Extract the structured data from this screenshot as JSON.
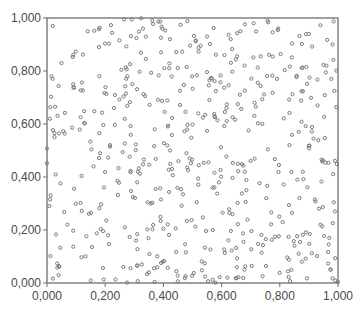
{
  "chart_data": {
    "type": "scatter",
    "title": "",
    "xlabel": "",
    "ylabel": "",
    "xlim": [
      0,
      1
    ],
    "ylim": [
      0,
      1
    ],
    "grid": false,
    "legend": null,
    "x_ticks": [
      0,
      0.2,
      0.4,
      0.6,
      0.8,
      1.0
    ],
    "y_ticks": [
      0,
      0.2,
      0.4,
      0.6,
      0.8,
      1.0
    ],
    "x_tick_labels": [
      "0,000",
      "0,200",
      "0,400",
      "0,600",
      "0,800",
      "1,000"
    ],
    "y_tick_labels": [
      "0,000",
      "0,200",
      "0,400",
      "0,600",
      "0,800",
      "1,000"
    ],
    "marker": "open-circle",
    "marker_color": "#7a7a7a",
    "distribution": "uniform random on unit square",
    "point_count_estimate": 560,
    "series": [
      {
        "name": "points",
        "sample_points": [
          [
            0.02,
            0.97
          ],
          [
            0.14,
            0.95
          ],
          [
            0.33,
            0.96
          ],
          [
            0.55,
            0.93
          ],
          [
            0.71,
            0.98
          ],
          [
            0.9,
            0.94
          ],
          [
            0.05,
            0.83
          ],
          [
            0.18,
            0.78
          ],
          [
            0.42,
            0.81
          ],
          [
            0.61,
            0.86
          ],
          [
            0.79,
            0.77
          ],
          [
            0.96,
            0.82
          ],
          [
            0.01,
            0.62
          ],
          [
            0.23,
            0.66
          ],
          [
            0.37,
            0.58
          ],
          [
            0.52,
            0.64
          ],
          [
            0.74,
            0.6
          ],
          [
            0.93,
            0.67
          ],
          [
            0.03,
            0.41
          ],
          [
            0.16,
            0.44
          ],
          [
            0.31,
            0.38
          ],
          [
            0.49,
            0.47
          ],
          [
            0.68,
            0.42
          ],
          [
            0.86,
            0.39
          ],
          [
            0.07,
            0.22
          ],
          [
            0.21,
            0.18
          ],
          [
            0.39,
            0.25
          ],
          [
            0.57,
            0.2
          ],
          [
            0.81,
            0.23
          ],
          [
            0.97,
            0.17
          ],
          [
            0.04,
            0.03
          ],
          [
            0.15,
            0.01
          ],
          [
            0.35,
            0.04
          ],
          [
            0.62,
            0.02
          ],
          [
            0.84,
            0.05
          ],
          [
            0.99,
            0.01
          ]
        ]
      }
    ]
  },
  "layout": {
    "plot_left": 47,
    "plot_top": 18,
    "plot_right": 338,
    "plot_bottom": 283,
    "seed": 12345
  }
}
